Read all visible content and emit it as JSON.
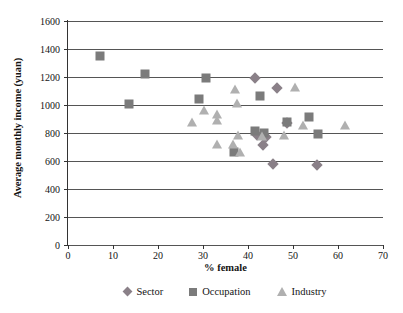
{
  "chart_data": {
    "type": "scatter",
    "title": "",
    "xlabel": "% female",
    "ylabel": "Average monthly income (yuan)",
    "xlim": [
      0,
      70
    ],
    "ylim": [
      0,
      1600
    ],
    "xticks": [
      0,
      10,
      20,
      30,
      40,
      50,
      60,
      70
    ],
    "yticks": [
      0,
      200,
      400,
      600,
      800,
      1000,
      1200,
      1400,
      1600
    ],
    "grid": "horizontal",
    "legend_position": "bottom",
    "series": [
      {
        "name": "Sector",
        "marker": "diamond",
        "color": "#8a8088",
        "points": [
          [
            41.5,
            1190
          ],
          [
            46.5,
            1125
          ],
          [
            42.0,
            785
          ],
          [
            43.4,
            715
          ],
          [
            44.0,
            770
          ],
          [
            45.5,
            578
          ],
          [
            48.6,
            875
          ],
          [
            55.4,
            572
          ]
        ]
      },
      {
        "name": "Occupation",
        "marker": "square",
        "color": "#7b7b7b",
        "points": [
          [
            7.2,
            1350
          ],
          [
            13.5,
            1008
          ],
          [
            17.0,
            1225
          ],
          [
            29.0,
            1045
          ],
          [
            30.6,
            1195
          ],
          [
            36.9,
            665
          ],
          [
            41.6,
            812
          ],
          [
            42.6,
            1065
          ],
          [
            43.6,
            800
          ],
          [
            48.6,
            880
          ],
          [
            53.6,
            912
          ],
          [
            55.5,
            795
          ]
        ]
      },
      {
        "name": "Industry",
        "marker": "triangle",
        "color": "#b0b0b0",
        "points": [
          [
            27.6,
            880
          ],
          [
            30.2,
            965
          ],
          [
            33.0,
            937
          ],
          [
            33.2,
            895
          ],
          [
            33.2,
            725
          ],
          [
            36.6,
            718
          ],
          [
            37.2,
            1115
          ],
          [
            37.6,
            1015
          ],
          [
            37.7,
            785
          ],
          [
            38.2,
            662
          ],
          [
            43.0,
            780
          ],
          [
            48.0,
            785
          ],
          [
            50.4,
            1130
          ],
          [
            52.3,
            858
          ],
          [
            61.5,
            860
          ]
        ]
      }
    ]
  },
  "axes": {
    "y_title": "Average monthly income (yuan)",
    "x_title": "% female"
  },
  "legend": {
    "items": [
      {
        "label": "Sector",
        "marker": "diamond-icon"
      },
      {
        "label": "Occupation",
        "marker": "square-icon"
      },
      {
        "label": "Industry",
        "marker": "triangle-icon"
      }
    ]
  }
}
